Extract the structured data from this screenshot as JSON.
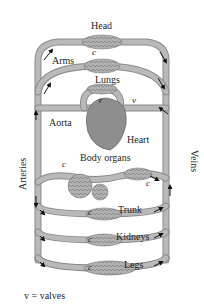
{
  "diagram": {
    "type": "circulatory-system-schematic",
    "colors": {
      "vessel": "#b9b9b9",
      "vessel_edge": "#8a8a8a",
      "capillary_bed": "#a8a8a8",
      "heart": "#8e8e8e",
      "arrow": "#111111",
      "background": "#ffffff"
    },
    "labels": {
      "head": "Head",
      "arms": "Arms",
      "lungs": "Lungs",
      "aorta": "Aorta",
      "heart": "Heart",
      "body_organs": "Body organs",
      "trunk": "Trunk",
      "kidneys": "Kidneys",
      "legs": "Legs",
      "arteries": "Arteries",
      "veins": "Veins"
    },
    "markers": {
      "capillary": "c",
      "valve": "v"
    },
    "legend": "v = valves"
  }
}
